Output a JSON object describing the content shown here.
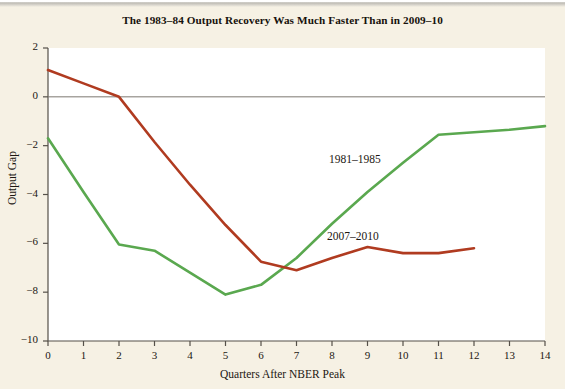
{
  "chart_data": {
    "type": "line",
    "title": "The 1983–84 Output Recovery Was Much Faster Than in 2009–10",
    "xlabel": "Quarters After NBER Peak",
    "ylabel": "Output Gap",
    "xlim": [
      0,
      14
    ],
    "ylim": [
      -10,
      2
    ],
    "xticks": [
      0,
      1,
      2,
      3,
      4,
      5,
      6,
      7,
      8,
      9,
      10,
      11,
      12,
      13,
      14
    ],
    "xtick_labels": [
      "0",
      "1",
      "2",
      "3",
      "4",
      "5",
      "6",
      "7",
      "8",
      "9",
      "10",
      "11",
      "12",
      "13",
      "14"
    ],
    "yticks": [
      2,
      0,
      -2,
      -4,
      -6,
      -8,
      -10
    ],
    "ytick_labels": [
      "2",
      "0",
      "−2",
      "−4",
      "−6",
      "−8",
      "−10"
    ],
    "grid": false,
    "zero_line": true,
    "legend": "inline-annotations",
    "series": [
      {
        "name": "1981–1985",
        "color": "#5aa84f",
        "annotation": "1981–1985",
        "x": [
          0,
          1,
          2,
          3,
          4,
          5,
          6,
          7,
          8,
          9,
          10,
          11,
          12,
          13,
          14
        ],
        "values": [
          -1.7,
          -3.9,
          -6.05,
          -6.3,
          -7.2,
          -8.1,
          -7.7,
          -6.6,
          -5.2,
          -3.9,
          -2.7,
          -1.55,
          -1.45,
          -1.35,
          -1.2
        ]
      },
      {
        "name": "2007–2010",
        "color": "#b03b20",
        "annotation": "2007–2010",
        "x": [
          0,
          1,
          2,
          3,
          4,
          5,
          6,
          7,
          8,
          9,
          10,
          11,
          12
        ],
        "values": [
          1.1,
          0.55,
          0.0,
          -1.85,
          -3.6,
          -5.25,
          -6.75,
          -7.1,
          -6.6,
          -6.15,
          -6.4,
          -6.4,
          -6.2
        ]
      }
    ]
  },
  "colors": {
    "background": "#f6f1e4",
    "plot_background": "#ffffff",
    "axis": "#555049",
    "zero_line": "#7d7870",
    "series_green": "#5aa84f",
    "series_red": "#b03b20",
    "text": "#1c1712"
  }
}
